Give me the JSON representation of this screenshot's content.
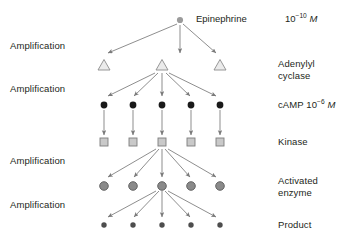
{
  "figure": {
    "type": "signal-amplification-cascade",
    "top_node_label": "Epinephrine",
    "top_concentration": "10⁻¹⁰ M",
    "amplification_label": "Amplification",
    "amplification_count": 4,
    "rows": [
      {
        "id": "epinephrine",
        "label": "Epinephrine",
        "right_label": "10⁻¹⁰ M",
        "node_shape": "dot-small-gray",
        "node_count": 1,
        "y": 20,
        "xs": [
          180
        ]
      },
      {
        "id": "adenylyl-cyclase",
        "label": "Adenylyl cyclase",
        "label_line1": "Adenylyl",
        "label_line2": "cyclase",
        "node_shape": "triangle-outline",
        "node_count": 3,
        "y": 65,
        "xs": [
          104,
          162,
          220
        ]
      },
      {
        "id": "camp",
        "label": "cAMP 10⁻⁶ M",
        "node_shape": "dot-black",
        "node_count": 5,
        "y": 105,
        "xs": [
          104,
          133,
          162,
          191,
          220
        ]
      },
      {
        "id": "kinase",
        "label": "Kinase",
        "node_shape": "square-gray",
        "node_count": 5,
        "y": 142,
        "xs": [
          104,
          133,
          162,
          191,
          220
        ]
      },
      {
        "id": "activated-enzyme",
        "label": "Activated enzyme",
        "label_line1": "Activated",
        "label_line2": "enzyme",
        "node_shape": "circle-gray",
        "node_count": 5,
        "y": 186,
        "xs": [
          104,
          133,
          162,
          191,
          220
        ]
      },
      {
        "id": "product",
        "label": "Product",
        "node_shape": "dot-darkgray",
        "node_count": 5,
        "y": 225,
        "xs": [
          104,
          133,
          162,
          191,
          220
        ]
      }
    ],
    "amplification_positions_y": [
      45,
      88,
      160,
      204
    ],
    "colors": {
      "text": "#231f20",
      "arrow": "#7a7a7a",
      "dot_black": "#1a1a1a",
      "dot_gray": "#9b9b9b",
      "dot_darkgray": "#4d4d4d",
      "triangle_fill": "#ebebeb",
      "triangle_stroke": "#8c8c8c",
      "square_fill": "#c9c9c9",
      "square_stroke": "#7d7d7d",
      "circle_fill": "#8a8a8a",
      "circle_stroke": "#5a5a5a",
      "background": "#ffffff"
    }
  }
}
